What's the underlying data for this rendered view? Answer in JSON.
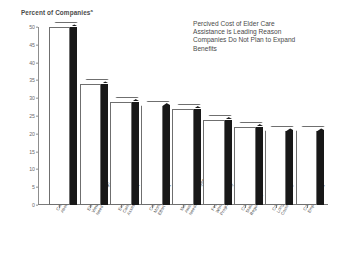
{
  "chart_data": {
    "type": "bar",
    "title": "Percived Cost of Elder Care\nAssistance is Leading Reason\nCompanies Do Not Plan to Expand\nBenefits",
    "ylabel": "Percent of Companies",
    "ylabel_superscript": "a",
    "xlabel": "",
    "ylim": [
      0,
      50
    ],
    "yticks": [
      0,
      5,
      10,
      15,
      20,
      25,
      30,
      35,
      40,
      45,
      50
    ],
    "ytick_labels": [
      "0",
      "5",
      "10",
      "15",
      "20",
      "25",
      "30",
      "35",
      "40",
      "45",
      "50"
    ],
    "grid": false,
    "legend": "none",
    "categories": [
      "Concerns\nAbout Costs",
      "Elder Care Not\nViewed as a High\nNeed",
      "Employees' Elder\nCare Needs Not\nAssessed",
      "Concerns About\nMonitoring Work\nEffort",
      "Management Not\nAware of Employee\nNeeds",
      "Fears to Implement\nWork and Family\nPrograms",
      "Concerns About\nState Federal\nRegulations",
      "Concerns About\nLong-Term Care\nCosts",
      "Concerns About\nEmployee Costs"
    ],
    "values": [
      50,
      34,
      29,
      28,
      27,
      24,
      22,
      21,
      21
    ],
    "bar_style": "3d-white-face-black-side",
    "colors": {
      "bar_face": "#ffffff",
      "bar_side": "#181818",
      "bar_outline": "#6f6f6f",
      "axis": "#8d8d8d",
      "text": "#4a4a4a",
      "background": "#ffffff"
    }
  }
}
